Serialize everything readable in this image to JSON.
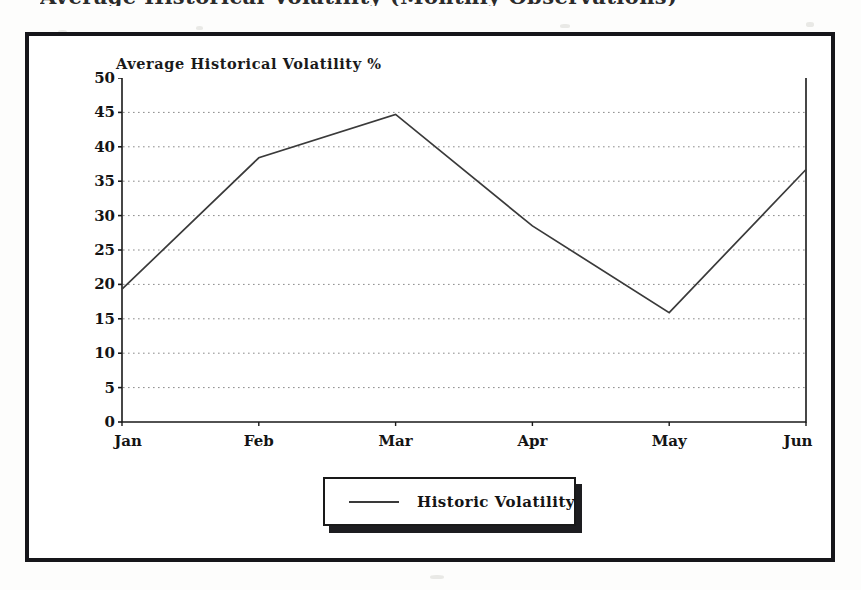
{
  "page": {
    "clipped_heading": "Average Historical Volatility (Monthly Observations)"
  },
  "legend": {
    "label": "Historic Volatility",
    "line_color": "#3a3a3a"
  },
  "colors": {
    "frame": "#16161a",
    "axis": "#1a1a1a",
    "grid": "#8a8a8a",
    "series": "#3a3a3a",
    "text": "#141414",
    "background": "#ffffff"
  },
  "chart_data": {
    "type": "line",
    "title": "Average Historical Volatility %",
    "xlabel": "",
    "ylabel": "",
    "categories": [
      "Jan",
      "Feb",
      "Mar",
      "Apr",
      "May",
      "Jun"
    ],
    "series": [
      {
        "name": "Historic Volatility",
        "values": [
          19.3,
          38.4,
          44.7,
          28.5,
          15.9,
          36.7
        ]
      }
    ],
    "ylim": [
      0,
      50
    ],
    "yticks": [
      0,
      5,
      10,
      15,
      20,
      25,
      30,
      35,
      40,
      45,
      50
    ],
    "ytick_labels": [
      "0",
      "5",
      "10",
      "15",
      "20",
      "25",
      "30",
      "35",
      "40",
      "45",
      "50"
    ],
    "grid": true,
    "grid_style": "dotted-horizontal",
    "legend_position": "below-center",
    "markers": false
  }
}
